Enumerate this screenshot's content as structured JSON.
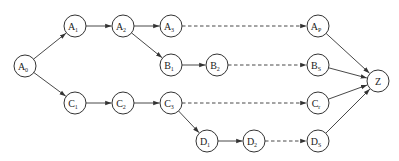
{
  "diagram": {
    "type": "directed-graph",
    "nodes": [
      {
        "id": "A0",
        "base": "A",
        "sub": "0",
        "x": 25,
        "y": 66
      },
      {
        "id": "A1",
        "base": "A",
        "sub": "1",
        "x": 75,
        "y": 26
      },
      {
        "id": "A2",
        "base": "A",
        "sub": "2",
        "x": 123,
        "y": 26
      },
      {
        "id": "A3",
        "base": "A",
        "sub": "3",
        "x": 171,
        "y": 26
      },
      {
        "id": "AP",
        "base": "A",
        "sub": "P",
        "x": 318,
        "y": 26
      },
      {
        "id": "B1",
        "base": "B",
        "sub": "1",
        "x": 171,
        "y": 65
      },
      {
        "id": "B2",
        "base": "B",
        "sub": "2",
        "x": 217,
        "y": 65
      },
      {
        "id": "BS",
        "base": "B",
        "sub": "S",
        "x": 318,
        "y": 65
      },
      {
        "id": "C1",
        "base": "C",
        "sub": "1",
        "x": 75,
        "y": 103
      },
      {
        "id": "C2",
        "base": "C",
        "sub": "2",
        "x": 123,
        "y": 103
      },
      {
        "id": "C3",
        "base": "C",
        "sub": "3",
        "x": 171,
        "y": 103
      },
      {
        "id": "Cr",
        "base": "C",
        "sub": "r",
        "x": 318,
        "y": 103
      },
      {
        "id": "D1",
        "base": "D",
        "sub": "1",
        "x": 207,
        "y": 141
      },
      {
        "id": "D2",
        "base": "D",
        "sub": "2",
        "x": 254,
        "y": 141
      },
      {
        "id": "DS",
        "base": "D",
        "sub": "S",
        "x": 318,
        "y": 141
      },
      {
        "id": "Z",
        "base": "Z",
        "sub": "",
        "x": 378,
        "y": 81
      }
    ],
    "edges": [
      {
        "from": "A0",
        "to": "A1",
        "style": "solid"
      },
      {
        "from": "A0",
        "to": "C1",
        "style": "solid"
      },
      {
        "from": "A1",
        "to": "A2",
        "style": "solid"
      },
      {
        "from": "A2",
        "to": "A3",
        "style": "solid"
      },
      {
        "from": "A2",
        "to": "B1",
        "style": "solid"
      },
      {
        "from": "A3",
        "to": "AP",
        "style": "dashed"
      },
      {
        "from": "B1",
        "to": "B2",
        "style": "solid"
      },
      {
        "from": "B2",
        "to": "BS",
        "style": "dashed"
      },
      {
        "from": "C1",
        "to": "C2",
        "style": "solid"
      },
      {
        "from": "C2",
        "to": "C3",
        "style": "solid"
      },
      {
        "from": "C3",
        "to": "Cr",
        "style": "dashed"
      },
      {
        "from": "C3",
        "to": "D1",
        "style": "solid"
      },
      {
        "from": "D1",
        "to": "D2",
        "style": "solid"
      },
      {
        "from": "D2",
        "to": "DS",
        "style": "dashed"
      },
      {
        "from": "AP",
        "to": "Z",
        "style": "solid"
      },
      {
        "from": "BS",
        "to": "Z",
        "style": "solid"
      },
      {
        "from": "Cr",
        "to": "Z",
        "style": "solid"
      },
      {
        "from": "DS",
        "to": "Z",
        "style": "solid"
      }
    ],
    "node_radius": 11,
    "colors": {
      "stroke": "#333333",
      "background": "#ffffff"
    }
  }
}
